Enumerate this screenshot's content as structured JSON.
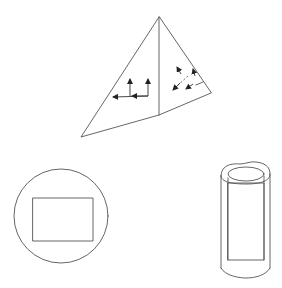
{
  "diagram": {
    "background": "#ffffff",
    "line_color": "#555555",
    "arrow_color": "#222222",
    "shapes": [
      {
        "id": "pyramid",
        "kind": "folded-triangle",
        "apex": [
          159,
          17
        ],
        "left": [
          81,
          137
        ],
        "right": [
          211,
          93
        ],
        "fold_bottom": [
          159,
          115
        ]
      },
      {
        "id": "circle-with-rectangle",
        "kind": "circle",
        "center": [
          61,
          216
        ],
        "radius": 47,
        "inner_rect": [
          33,
          198,
          60,
          43
        ]
      },
      {
        "id": "cylinder",
        "kind": "cylinder",
        "x_range": [
          220,
          270
        ],
        "y_range": [
          160,
          278
        ]
      }
    ],
    "arrows": [
      {
        "face": "left",
        "count": 4,
        "style": "solid"
      },
      {
        "face": "right",
        "count": 4,
        "style": "mixed-dashed"
      }
    ]
  }
}
